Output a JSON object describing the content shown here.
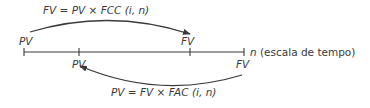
{
  "diagram": {
    "top_formula": "FV = PV × FCC (i, n)",
    "bottom_formula": "PV = FV × FAC (i, n)",
    "timeline_label_var": "n",
    "timeline_label_text": " (escala de tempo)",
    "labels": {
      "top_left": "PV",
      "top_right": "FV",
      "bottom_left": "PV",
      "bottom_right": "FV"
    },
    "arrows": [
      {
        "from": "PV",
        "to": "FV",
        "direction": "forward",
        "formula": "FV = PV × FCC (i, n)"
      },
      {
        "from": "FV",
        "to": "PV",
        "direction": "backward",
        "formula": "PV = FV × FAC (i, n)"
      }
    ],
    "colors": {
      "ink": "#3a3a3a"
    }
  }
}
